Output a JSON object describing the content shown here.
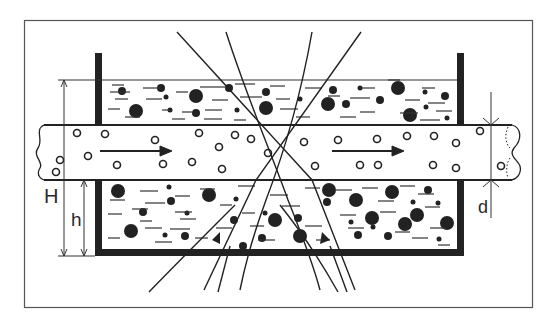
{
  "diagram": {
    "labels": {
      "H": "H",
      "h": "h",
      "d": "d"
    },
    "elements": {
      "frame": "outer-border",
      "tank": "open-tank-with-walls",
      "pipe": "horizontal-pipe-with-broken-ends",
      "flow_arrows": 2,
      "rays": 6
    },
    "colors": {
      "ink": "#222222",
      "background": "#ffffff",
      "frame": "#555555"
    }
  }
}
